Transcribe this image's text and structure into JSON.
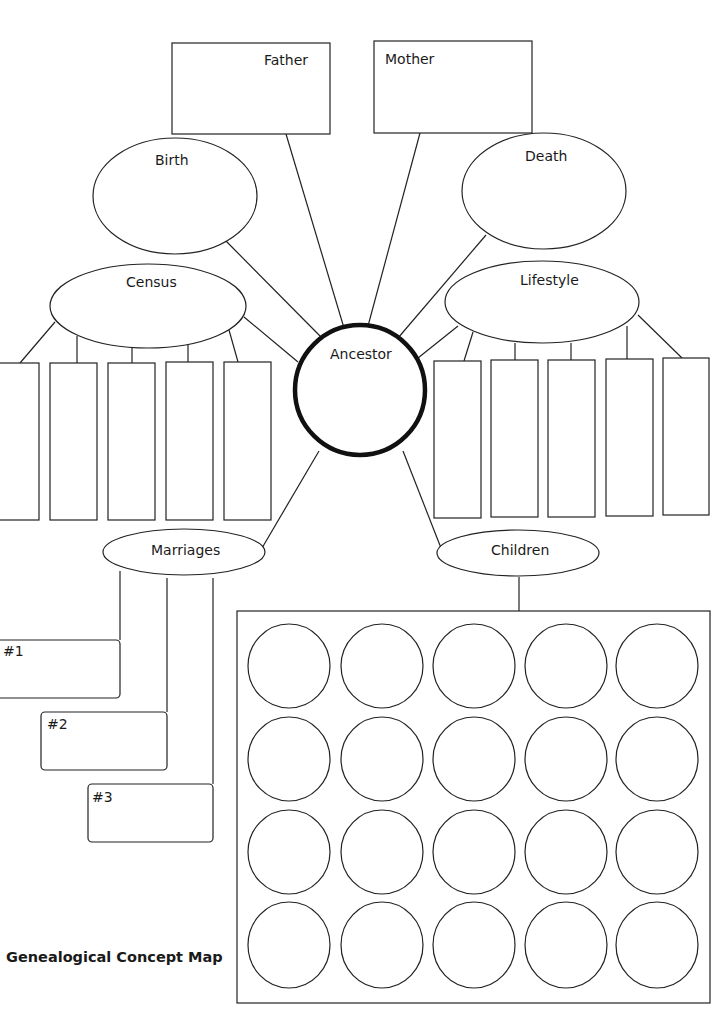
{
  "title": "Genealogical Concept Map",
  "center": {
    "label": "Ancestor"
  },
  "parents": [
    {
      "label": "Father"
    },
    {
      "label": "Mother"
    }
  ],
  "events": [
    {
      "label": "Birth"
    },
    {
      "label": "Death"
    }
  ],
  "branches": {
    "census": {
      "label": "Census",
      "box_count": 5
    },
    "lifestyle": {
      "label": "Lifestyle",
      "box_count": 5
    },
    "marriages": {
      "label": "Marriages",
      "items": [
        {
          "label": "#1"
        },
        {
          "label": "#2"
        },
        {
          "label": "#3"
        }
      ]
    },
    "children": {
      "label": "Children",
      "rows": 4,
      "cols": 5
    }
  },
  "colors": {
    "stroke": "#222222",
    "background": "#ffffff",
    "center_stroke": "#111111"
  }
}
